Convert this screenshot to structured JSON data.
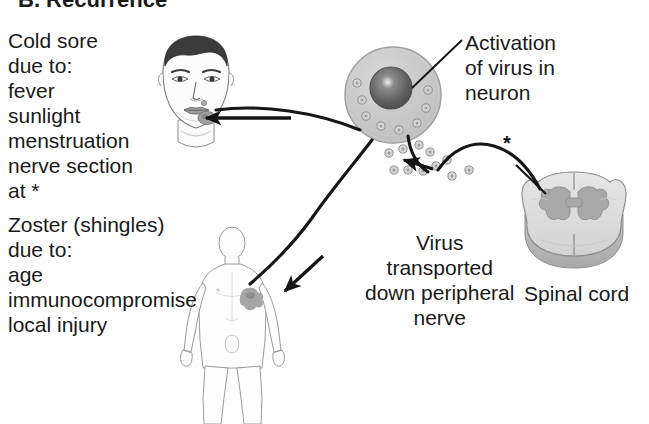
{
  "figure": {
    "title": "B. Recurrence",
    "background_color": "#ffffff",
    "ink_color": "#1a1a1a"
  },
  "labels": {
    "cold_sore": "Cold sore\ndue to:\nfever\nsunlight\nmenstruation\nnerve section\nat *",
    "zoster": "Zoster (shingles)\ndue to:\nage\nimmunocompromise\nlocal injury",
    "activation": "Activation\nof virus in\nneuron",
    "transport": "Virus\ntransported\ndown peripheral\nnerve",
    "spinal_cord": "Spinal cord",
    "asterisk_nerve": "*"
  },
  "structures": [
    {
      "name": "face-with-cold-sore",
      "caption": "Cold sore",
      "lesion_color": "#9a9a9a"
    },
    {
      "name": "neuron-cell-body",
      "caption": "Activation of virus in neuron",
      "body_color": "#c9c9c9",
      "nucleus_color": "#5a5a5a"
    },
    {
      "name": "spinal-cord-cross-section",
      "caption": "Spinal cord",
      "white_matter_color": "#dcdcdc",
      "gray_matter_color": "#a8a8a8"
    },
    {
      "name": "body-with-shingles-rash",
      "caption": "Zoster (shingles)",
      "rash_color": "#a6a6a6"
    }
  ],
  "flow": [
    {
      "from": "neuron-cell-body",
      "to": "face-with-cold-sore",
      "arrow": "left"
    },
    {
      "from": "neuron-cell-body",
      "to": "body-with-shingles-rash",
      "arrow": "down-left"
    },
    {
      "from": "spinal-cord-cross-section",
      "to": "neuron-cell-body",
      "arrow": "left"
    }
  ]
}
